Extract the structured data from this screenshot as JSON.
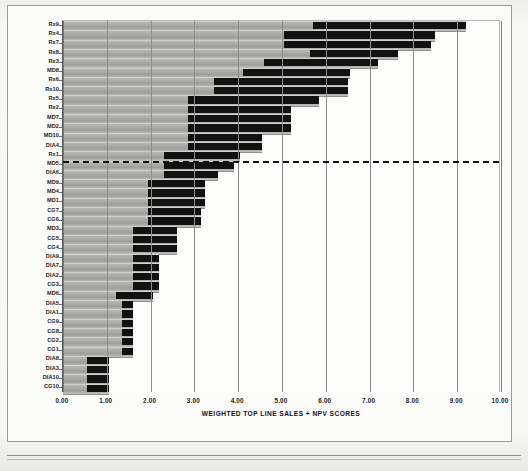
{
  "chart_data": {
    "type": "bar",
    "subtype": "floating-range-bar",
    "title": "",
    "xlabel": "WEIGHTED TOP LINE SALES + NPV SCORES",
    "ylabel": "",
    "xlim": [
      0.0,
      10.0
    ],
    "xticks": [
      "0.00",
      "1.00",
      "2.00",
      "3.00",
      "4.00",
      "5.00",
      "6.00",
      "7.00",
      "8.00",
      "9.00",
      "10.00"
    ],
    "xtick_values": [
      0,
      1,
      2,
      3,
      4,
      5,
      6,
      7,
      8,
      9,
      10
    ],
    "grid": true,
    "legend": null,
    "orientation": "horizontal",
    "categories": [
      "Rx9",
      "Rx4",
      "Rx7",
      "Rx8",
      "Rx3",
      "MD8",
      "Rx6",
      "Rx10",
      "Rx5",
      "Rx2",
      "MD7",
      "MD2",
      "MD10",
      "DIA4",
      "Rx1",
      "MD5",
      "DIA6",
      "MD9",
      "MD4",
      "MD1",
      "CG7",
      "CG6",
      "MD3",
      "CG5",
      "CG4",
      "DIA9",
      "DIA7",
      "DIA2",
      "CG3",
      "MD6",
      "DIA5",
      "DIA1",
      "CG9",
      "CG8",
      "CG2",
      "CG1",
      "DIA8",
      "DIA3",
      "DIA10",
      "CG10"
    ],
    "series": [
      {
        "name": "range low",
        "values": [
          5.7,
          5.05,
          5.05,
          5.65,
          4.6,
          4.1,
          3.45,
          3.45,
          2.85,
          2.85,
          2.85,
          2.85,
          2.85,
          2.85,
          2.3,
          2.3,
          2.3,
          1.95,
          1.95,
          1.95,
          1.95,
          1.95,
          1.6,
          1.6,
          1.6,
          1.6,
          1.6,
          1.6,
          1.6,
          1.2,
          1.35,
          1.35,
          1.35,
          1.35,
          1.35,
          1.35,
          0.55,
          0.55,
          0.55,
          0.55
        ]
      },
      {
        "name": "range high",
        "values": [
          9.2,
          8.5,
          8.4,
          7.65,
          7.2,
          6.55,
          6.5,
          6.5,
          5.85,
          5.2,
          5.2,
          5.2,
          4.55,
          4.55,
          4.05,
          3.9,
          3.55,
          3.25,
          3.25,
          3.25,
          3.15,
          3.15,
          2.6,
          2.6,
          2.6,
          2.2,
          2.2,
          2.2,
          2.2,
          2.05,
          1.6,
          1.6,
          1.6,
          1.6,
          1.6,
          1.6,
          1.05,
          1.05,
          1.05,
          1.05
        ]
      }
    ],
    "threshold": {
      "after_category": "Rx1",
      "style": "dashed",
      "color": "#141414"
    }
  },
  "axis": {
    "x_title": "WEIGHTED TOP LINE SALES + NPV SCORES"
  }
}
